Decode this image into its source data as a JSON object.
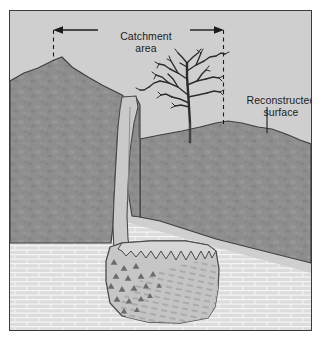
{
  "figure": {
    "kind": "geological-cross-section"
  },
  "annotations": {
    "catchment": {
      "line1": "Catchment",
      "line2": "area"
    },
    "reconstructed": {
      "line1": "Reconstructed",
      "line2": "surface"
    }
  },
  "colors": {
    "page": "#ffffff",
    "frame_border": "#3b3b3b",
    "sky": "#cfcfcf",
    "upper_rock": "#8e8e8e",
    "limestone": "#dcdcdc",
    "limestone_line": "#ffffff",
    "fissure_fill": "#c6c6c6",
    "cave_fill": "#bfbfbf",
    "cave_fill_light": "#cecece",
    "clast": "#6a6a6a",
    "outline": "#4a4a4a",
    "ink": "#1c1c1c"
  },
  "elements": {
    "catchment_arrow": {
      "x_left": 53,
      "x_right": 222,
      "y": 29
    },
    "catchment_dash_left": {
      "x": 53,
      "y_top": 29,
      "y_bottom": 60
    },
    "catchment_dash_right": {
      "x": 222,
      "y_top": 29,
      "y_bottom": 126
    },
    "reconstructed_leader": {
      "x": 266,
      "y_top": 106,
      "y_bottom": 132
    },
    "hill_peak": {
      "x": 53,
      "y": 58
    },
    "tree": {
      "trunk_x": 180,
      "base_y": 131,
      "top_y": 43
    },
    "fissure": {
      "top_y": 96,
      "bottom_y": 243
    },
    "cave": {
      "top_y": 243,
      "bottom_y": 318
    }
  }
}
